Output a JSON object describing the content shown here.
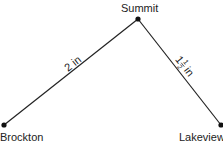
{
  "points": {
    "summit": {
      "label": "Summit"
    },
    "brockton": {
      "label": "Brockton"
    },
    "lakeview": {
      "label": "Lakeview"
    }
  },
  "edges": {
    "brockton_summit": {
      "label": "2 in"
    },
    "summit_lakeview": {
      "whole": "1",
      "num": "1",
      "den": "2",
      "unit": "in"
    }
  },
  "colors": {
    "line": "#222222",
    "text": "#222222"
  }
}
